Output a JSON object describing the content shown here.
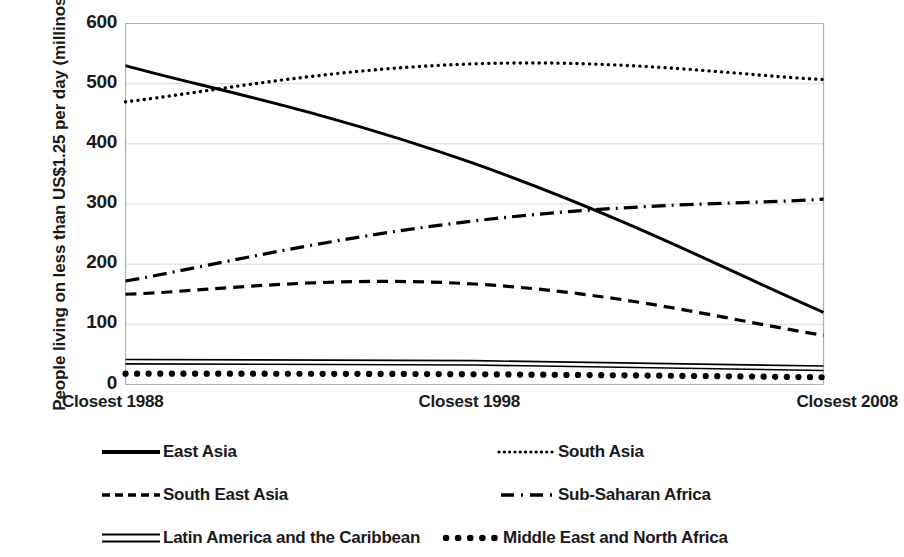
{
  "chart_data": {
    "type": "line",
    "title": "",
    "subtitle": "",
    "xlabel": "",
    "ylabel": "People living on less than US$1.25 per day (millinos)",
    "categories": [
      "Closest 1988",
      "Closest 1998",
      "Closest 2008"
    ],
    "x_tick_labels": [
      "Closest 1988",
      "Closest 1998",
      "Closest 2008"
    ],
    "y_tick_labels": [
      "600",
      "500",
      "400",
      "300",
      "200",
      "100",
      "0"
    ],
    "y_ticks": [
      600,
      500,
      400,
      300,
      200,
      100,
      0
    ],
    "ylim": [
      0,
      600
    ],
    "grid": "horizontal",
    "legend_position": "bottom",
    "units": "millions of people",
    "series": [
      {
        "name": "East Asia",
        "values": [
          530,
          367,
          120
        ],
        "line_style": "solid",
        "color": "#000000",
        "legend_marker": "solid-line"
      },
      {
        "name": "South Asia",
        "values": [
          470,
          533,
          507
        ],
        "line_style": "dotted",
        "color": "#000000",
        "legend_marker": "dotted-line"
      },
      {
        "name": "South East Asia",
        "values": [
          150,
          167,
          82
        ],
        "line_style": "dashed",
        "color": "#000000",
        "legend_marker": "dashed-line"
      },
      {
        "name": "Sub-Saharan Africa",
        "values": [
          172,
          272,
          308
        ],
        "line_style": "dash-dot",
        "color": "#000000",
        "legend_marker": "dash-dot-line"
      },
      {
        "name": "Latin America and the Caribbean",
        "values": [
          38,
          36,
          27
        ],
        "line_style": "double-solid",
        "color": "#000000",
        "legend_marker": "double-line"
      },
      {
        "name": "Middle East and North Africa",
        "values": [
          18,
          17,
          12
        ],
        "line_style": "thick-dotted",
        "color": "#000000",
        "legend_marker": "thick-dotted-line"
      }
    ],
    "axis_color": "#b0b0b0",
    "gridline_color": "#d9d9d9",
    "background_color": "#ffffff"
  },
  "legend": {
    "rows": [
      [
        {
          "label": "East Asia",
          "marker": "solid-line"
        },
        {
          "label": "South Asia",
          "marker": "dotted-line"
        }
      ],
      [
        {
          "label": "South East Asia",
          "marker": "dashed-line"
        },
        {
          "label": "Sub-Saharan Africa",
          "marker": "dash-dot-line"
        }
      ],
      [
        {
          "label": "Latin America and the Caribbean",
          "marker": "double-line"
        },
        {
          "label": "Middle East and North Africa",
          "marker": "thick-dotted-line"
        }
      ]
    ]
  }
}
